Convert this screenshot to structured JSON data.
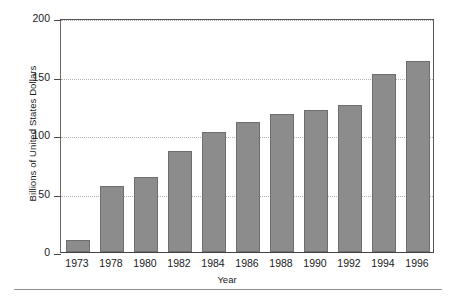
{
  "chart_data": {
    "type": "bar",
    "title": "",
    "xlabel": "Year",
    "ylabel": "Billions of United States Dollars",
    "categories": [
      "1973",
      "1978",
      "1980",
      "1982",
      "1984",
      "1986",
      "1988",
      "1990",
      "1992",
      "1994",
      "1996"
    ],
    "values": [
      10,
      56,
      64,
      86,
      103,
      111,
      118,
      121,
      126,
      152,
      163
    ],
    "ylim": [
      0,
      200
    ],
    "yticks": [
      0,
      50,
      100,
      150,
      200
    ],
    "ytick_labels": [
      "0",
      "50",
      "100",
      "150",
      "200"
    ],
    "grid": "horizontal-dotted",
    "legend": "none",
    "bar_color": "#8c8c8c",
    "bar_edge_color": "#6e6e6e",
    "gridline_color": "#b3b3b3",
    "axis_color": "#555555",
    "background_color": "#ffffff"
  }
}
